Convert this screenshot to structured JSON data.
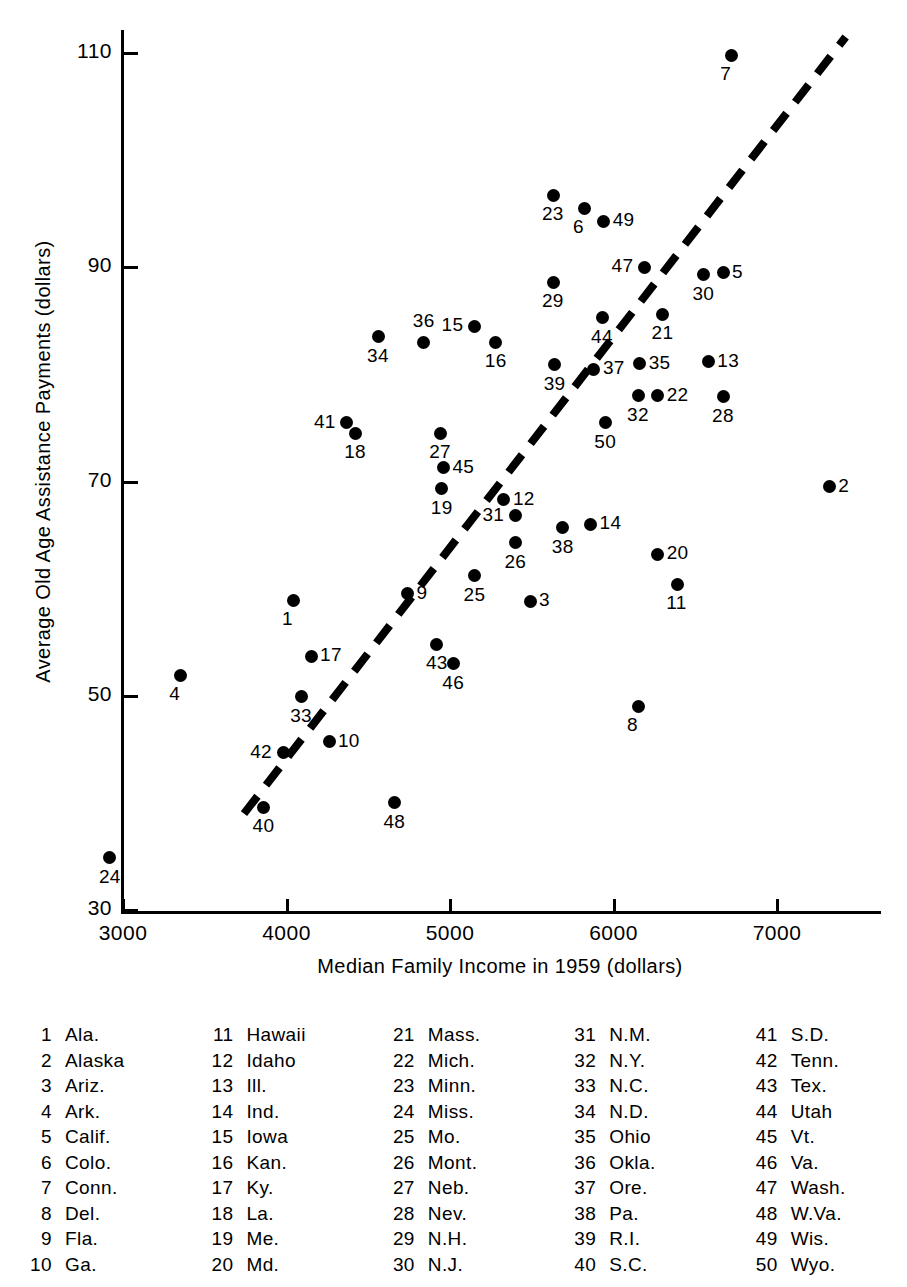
{
  "chart_data": {
    "type": "scatter",
    "title": "",
    "xlabel": "Median Family Income in 1959 (dollars)",
    "ylabel": "Average Old Age Assistance Payments (dollars)",
    "xlim": [
      2650,
      7500
    ],
    "ylim": [
      30,
      112
    ],
    "xticks": [
      3000,
      4000,
      5000,
      6000,
      7000
    ],
    "yticks": [
      30,
      50,
      70,
      90,
      110
    ],
    "grid": false,
    "legend_position": "below-plot-table",
    "trendline": {
      "style": "dashed",
      "x": [
        3740,
        7420
      ],
      "y": [
        39.0,
        111.5
      ]
    },
    "points": [
      {
        "id": 1,
        "label": "Ala.",
        "x": 4040,
        "y": 58.9,
        "label_pos": "below"
      },
      {
        "id": 2,
        "label": "Alaska",
        "x": 7320,
        "y": 69.5,
        "label_pos": "right"
      },
      {
        "id": 3,
        "label": "Ariz.",
        "x": 5490,
        "y": 58.8,
        "label_pos": "right"
      },
      {
        "id": 4,
        "label": "Ark.",
        "x": 3350,
        "y": 51.9,
        "label_pos": "below"
      },
      {
        "id": 5,
        "label": "Calif.",
        "x": 6670,
        "y": 89.5,
        "label_pos": "right"
      },
      {
        "id": 6,
        "label": "Colo.",
        "x": 5820,
        "y": 95.5,
        "label_pos": "below"
      },
      {
        "id": 7,
        "label": "Conn.",
        "x": 6720,
        "y": 109.8,
        "label_pos": "below"
      },
      {
        "id": 8,
        "label": "Del.",
        "x": 6150,
        "y": 49.0,
        "label_pos": "below"
      },
      {
        "id": 9,
        "label": "Fla.",
        "x": 4740,
        "y": 59.5,
        "label_pos": "right"
      },
      {
        "id": 10,
        "label": "Ga.",
        "x": 4260,
        "y": 45.7,
        "label_pos": "right"
      },
      {
        "id": 11,
        "label": "Hawaii",
        "x": 6390,
        "y": 60.4,
        "label_pos": "below"
      },
      {
        "id": 12,
        "label": "Idaho",
        "x": 5330,
        "y": 68.3,
        "label_pos": "right"
      },
      {
        "id": 13,
        "label": "Ill.",
        "x": 6580,
        "y": 81.2,
        "label_pos": "right"
      },
      {
        "id": 14,
        "label": "Ind.",
        "x": 5860,
        "y": 66.0,
        "label_pos": "right"
      },
      {
        "id": 15,
        "label": "Iowa",
        "x": 5150,
        "y": 84.5,
        "label_pos": "left"
      },
      {
        "id": 16,
        "label": "Kan.",
        "x": 5280,
        "y": 83.0,
        "label_pos": "below"
      },
      {
        "id": 17,
        "label": "Ky.",
        "x": 4150,
        "y": 53.7,
        "label_pos": "right"
      },
      {
        "id": 18,
        "label": "La.",
        "x": 4420,
        "y": 74.5,
        "label_pos": "below"
      },
      {
        "id": 19,
        "label": "Me.",
        "x": 4950,
        "y": 69.3,
        "label_pos": "below"
      },
      {
        "id": 20,
        "label": "Md.",
        "x": 6270,
        "y": 63.2,
        "label_pos": "right"
      },
      {
        "id": 21,
        "label": "Mass.",
        "x": 6300,
        "y": 85.6,
        "label_pos": "below"
      },
      {
        "id": 22,
        "label": "Mich.",
        "x": 6270,
        "y": 78.0,
        "label_pos": "right"
      },
      {
        "id": 23,
        "label": "Minn.",
        "x": 5630,
        "y": 96.7,
        "label_pos": "below"
      },
      {
        "id": 24,
        "label": "Miss.",
        "x": 2920,
        "y": 34.9,
        "label_pos": "below"
      },
      {
        "id": 25,
        "label": "Mo.",
        "x": 5150,
        "y": 61.2,
        "label_pos": "below"
      },
      {
        "id": 26,
        "label": "Mont.",
        "x": 5400,
        "y": 64.3,
        "label_pos": "below"
      },
      {
        "id": 27,
        "label": "Neb.",
        "x": 4940,
        "y": 74.5,
        "label_pos": "below"
      },
      {
        "id": 28,
        "label": "Nev.",
        "x": 6670,
        "y": 77.9,
        "label_pos": "below"
      },
      {
        "id": 29,
        "label": "N.H.",
        "x": 5630,
        "y": 88.6,
        "label_pos": "below"
      },
      {
        "id": 30,
        "label": "N.J.",
        "x": 6550,
        "y": 89.3,
        "label_pos": "below"
      },
      {
        "id": 31,
        "label": "N.M.",
        "x": 5400,
        "y": 66.8,
        "label_pos": "left"
      },
      {
        "id": 32,
        "label": "N.Y.",
        "x": 6150,
        "y": 78.0,
        "label_pos": "below"
      },
      {
        "id": 33,
        "label": "N.C.",
        "x": 4090,
        "y": 49.9,
        "label_pos": "below"
      },
      {
        "id": 34,
        "label": "N.D.",
        "x": 4560,
        "y": 83.5,
        "label_pos": "below"
      },
      {
        "id": 35,
        "label": "Ohio",
        "x": 6160,
        "y": 81.0,
        "label_pos": "right"
      },
      {
        "id": 36,
        "label": "Okla.",
        "x": 4840,
        "y": 83.0,
        "label_pos": "above"
      },
      {
        "id": 37,
        "label": "Ore.",
        "x": 5880,
        "y": 80.5,
        "label_pos": "right"
      },
      {
        "id": 38,
        "label": "Pa.",
        "x": 5690,
        "y": 65.7,
        "label_pos": "below"
      },
      {
        "id": 39,
        "label": "R.I.",
        "x": 5640,
        "y": 80.9,
        "label_pos": "below"
      },
      {
        "id": 40,
        "label": "S.C.",
        "x": 3860,
        "y": 39.6,
        "label_pos": "below"
      },
      {
        "id": 41,
        "label": "S.D.",
        "x": 4370,
        "y": 75.5,
        "label_pos": "left"
      },
      {
        "id": 42,
        "label": "Tenn.",
        "x": 3980,
        "y": 44.7,
        "label_pos": "left"
      },
      {
        "id": 43,
        "label": "Tex.",
        "x": 4920,
        "y": 54.8,
        "label_pos": "below"
      },
      {
        "id": 44,
        "label": "Utah",
        "x": 5930,
        "y": 85.3,
        "label_pos": "below"
      },
      {
        "id": 45,
        "label": "Vt.",
        "x": 4960,
        "y": 71.3,
        "label_pos": "right"
      },
      {
        "id": 46,
        "label": "Va.",
        "x": 5020,
        "y": 53.0,
        "label_pos": "below"
      },
      {
        "id": 47,
        "label": "Wash.",
        "x": 6190,
        "y": 90.0,
        "label_pos": "left"
      },
      {
        "id": 48,
        "label": "W.Va.",
        "x": 4660,
        "y": 40.0,
        "label_pos": "below"
      },
      {
        "id": 49,
        "label": "Wis.",
        "x": 5940,
        "y": 94.3,
        "label_pos": "right"
      },
      {
        "id": 50,
        "label": "Wyo.",
        "x": 5950,
        "y": 75.5,
        "label_pos": "below"
      }
    ]
  },
  "axes": {
    "y_title": "Average Old Age Assistance Payments (dollars)",
    "x_title": "Median Family Income in 1959 (dollars)",
    "y_ticks": [
      "110",
      "90",
      "70",
      "50",
      "30"
    ],
    "x_ticks": [
      "3000",
      "4000",
      "5000",
      "6000",
      "7000"
    ]
  },
  "legend": {
    "columns": [
      [
        {
          "num": "1",
          "name": "Ala."
        },
        {
          "num": "2",
          "name": "Alaska"
        },
        {
          "num": "3",
          "name": "Ariz."
        },
        {
          "num": "4",
          "name": "Ark."
        },
        {
          "num": "5",
          "name": "Calif."
        },
        {
          "num": "6",
          "name": "Colo."
        },
        {
          "num": "7",
          "name": "Conn."
        },
        {
          "num": "8",
          "name": "Del."
        },
        {
          "num": "9",
          "name": "Fla."
        },
        {
          "num": "10",
          "name": "Ga."
        }
      ],
      [
        {
          "num": "11",
          "name": "Hawaii"
        },
        {
          "num": "12",
          "name": "Idaho"
        },
        {
          "num": "13",
          "name": "Ill."
        },
        {
          "num": "14",
          "name": "Ind."
        },
        {
          "num": "15",
          "name": "Iowa"
        },
        {
          "num": "16",
          "name": "Kan."
        },
        {
          "num": "17",
          "name": "Ky."
        },
        {
          "num": "18",
          "name": "La."
        },
        {
          "num": "19",
          "name": "Me."
        },
        {
          "num": "20",
          "name": "Md."
        }
      ],
      [
        {
          "num": "21",
          "name": "Mass."
        },
        {
          "num": "22",
          "name": "Mich."
        },
        {
          "num": "23",
          "name": "Minn."
        },
        {
          "num": "24",
          "name": "Miss."
        },
        {
          "num": "25",
          "name": "Mo."
        },
        {
          "num": "26",
          "name": "Mont."
        },
        {
          "num": "27",
          "name": "Neb."
        },
        {
          "num": "28",
          "name": "Nev."
        },
        {
          "num": "29",
          "name": "N.H."
        },
        {
          "num": "30",
          "name": "N.J."
        }
      ],
      [
        {
          "num": "31",
          "name": "N.M."
        },
        {
          "num": "32",
          "name": "N.Y."
        },
        {
          "num": "33",
          "name": "N.C."
        },
        {
          "num": "34",
          "name": "N.D."
        },
        {
          "num": "35",
          "name": "Ohio"
        },
        {
          "num": "36",
          "name": "Okla."
        },
        {
          "num": "37",
          "name": "Ore."
        },
        {
          "num": "38",
          "name": "Pa."
        },
        {
          "num": "39",
          "name": "R.I."
        },
        {
          "num": "40",
          "name": "S.C."
        }
      ],
      [
        {
          "num": "41",
          "name": "S.D."
        },
        {
          "num": "42",
          "name": "Tenn."
        },
        {
          "num": "43",
          "name": "Tex."
        },
        {
          "num": "44",
          "name": "Utah"
        },
        {
          "num": "45",
          "name": "Vt."
        },
        {
          "num": "46",
          "name": "Va."
        },
        {
          "num": "47",
          "name": "Wash."
        },
        {
          "num": "48",
          "name": "W.Va."
        },
        {
          "num": "49",
          "name": "Wis."
        },
        {
          "num": "50",
          "name": "Wyo."
        }
      ]
    ]
  },
  "colors": {
    "ink": "#000000",
    "paper": "#ffffff"
  }
}
